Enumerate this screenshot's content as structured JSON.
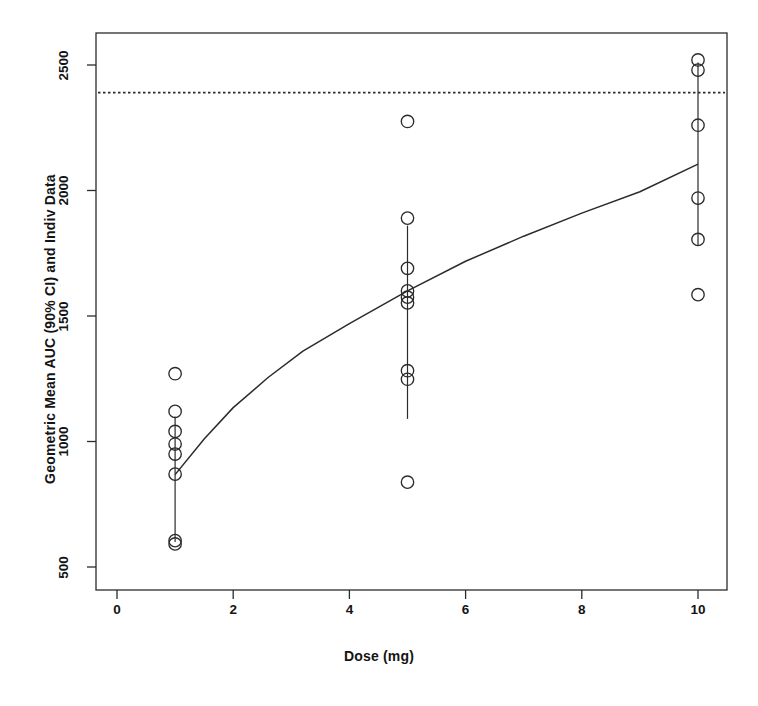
{
  "chart_data": {
    "type": "scatter",
    "title": "",
    "xlabel": "Dose (mg)",
    "ylabel": "Geometric Mean AUC (90% CI) and Indiv Data",
    "xlim": [
      0,
      11.0
    ],
    "ylim": [
      440,
      2620
    ],
    "xticks": [
      0,
      2,
      4,
      6,
      8,
      10
    ],
    "xtick_labels": [
      "0",
      "2",
      "4",
      "6",
      "8",
      "10"
    ],
    "yticks": [
      500,
      1000,
      1500,
      2000,
      2500
    ],
    "ytick_labels": [
      "500",
      "1000",
      "1500",
      "2000",
      "2500"
    ],
    "grid": false,
    "legend": null,
    "box": true,
    "series": [
      {
        "name": "Individual Data",
        "type": "scatter",
        "marker": "open-circle",
        "color": "#2b2b2b",
        "points": [
          {
            "x": 1,
            "y": 1270
          },
          {
            "x": 1,
            "y": 1120
          },
          {
            "x": 1,
            "y": 1040
          },
          {
            "x": 1,
            "y": 990
          },
          {
            "x": 1,
            "y": 950
          },
          {
            "x": 1,
            "y": 870
          },
          {
            "x": 1,
            "y": 605
          },
          {
            "x": 1,
            "y": 592
          },
          {
            "x": 5,
            "y": 2275
          },
          {
            "x": 5,
            "y": 1890
          },
          {
            "x": 5,
            "y": 1690
          },
          {
            "x": 5,
            "y": 1600
          },
          {
            "x": 5,
            "y": 1575
          },
          {
            "x": 5,
            "y": 1552
          },
          {
            "x": 5,
            "y": 1282
          },
          {
            "x": 5,
            "y": 1248
          },
          {
            "x": 5,
            "y": 838
          },
          {
            "x": 10,
            "y": 2520
          },
          {
            "x": 10,
            "y": 2480
          },
          {
            "x": 10,
            "y": 2260
          },
          {
            "x": 10,
            "y": 1970
          },
          {
            "x": 10,
            "y": 1805
          },
          {
            "x": 10,
            "y": 1585
          }
        ]
      },
      {
        "name": "Geometric Mean with 90% CI",
        "type": "errorbar",
        "color": "#2b2b2b",
        "points": [
          {
            "x": 1,
            "y": 930,
            "lo": 600,
            "hi": 1100
          },
          {
            "x": 5,
            "y": 1600,
            "lo": 1090,
            "hi": 1860
          },
          {
            "x": 10,
            "y": 2100,
            "lo": 1780,
            "hi": 2510
          }
        ]
      },
      {
        "name": "Model Predicted Geometric Mean AUC",
        "type": "line",
        "style": "solid",
        "color": "#2b2b2b",
        "x": [
          1.0,
          1.5,
          2.0,
          2.6,
          3.2,
          4.0,
          5.0,
          6.0,
          7.0,
          8.0,
          9.0,
          10.0
        ],
        "y": [
          868,
          1010,
          1135,
          1255,
          1360,
          1470,
          1600,
          1718,
          1818,
          1910,
          1995,
          2105
        ]
      },
      {
        "name": "Reference Threshold",
        "type": "hline",
        "style": "dotted",
        "color": "#2b2b2b",
        "y": 2390
      }
    ]
  },
  "axes": {
    "x_title": "Dose (mg)",
    "y_title": "Geometric Mean AUC (90% CI) and Indiv Data"
  }
}
